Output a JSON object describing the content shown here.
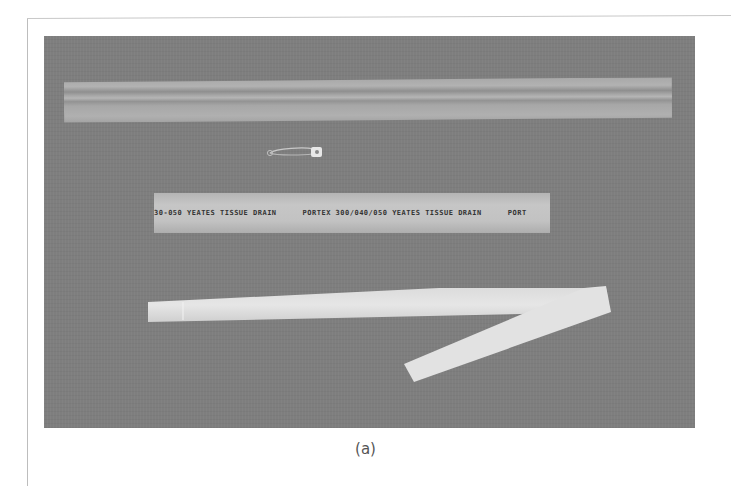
{
  "figure": {
    "caption": "(a)",
    "items": [
      {
        "name": "corrugated-drain",
        "description": "wide translucent corrugated drain tube"
      },
      {
        "name": "safety-pin",
        "description": "small safety pin"
      },
      {
        "name": "yeates-tissue-drain",
        "printed_text": [
          "30-050 YEATES TISSUE DRAIN",
          "PORTEX 300/040/050 YEATES TISSUE DRAIN",
          "PORT"
        ]
      },
      {
        "name": "tube-drain",
        "description": "folded white tubular drain"
      }
    ]
  },
  "colors": {
    "background": "#ffffff",
    "photo_background": "#7e7e7e",
    "caption": "#555555"
  }
}
